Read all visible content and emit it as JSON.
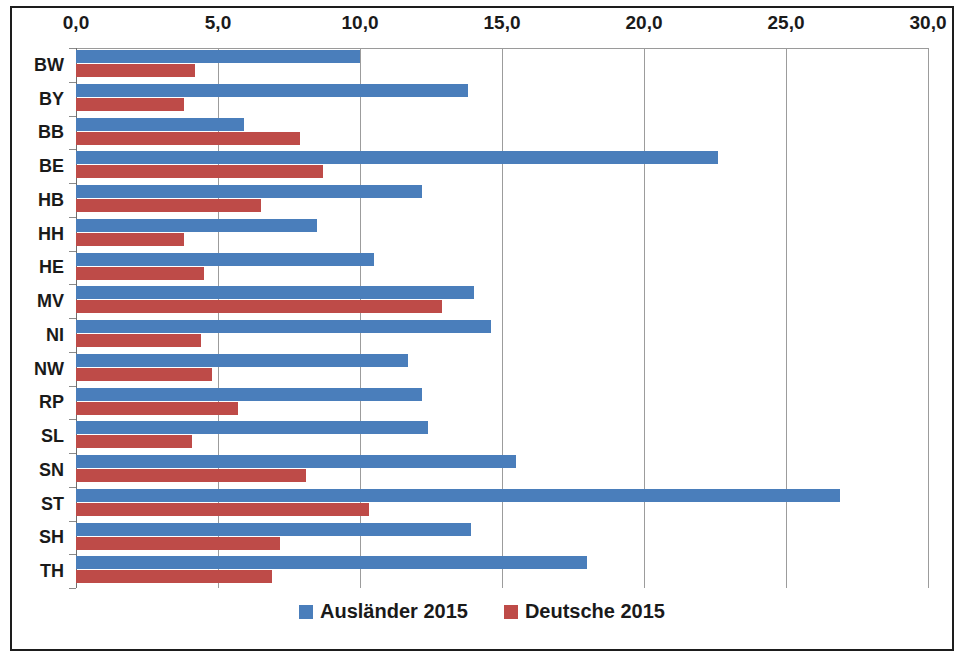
{
  "chart_data": {
    "type": "bar",
    "orientation": "horizontal",
    "title": "",
    "xlabel": "",
    "ylabel": "",
    "xlim": [
      0,
      30
    ],
    "xticks": [
      0,
      5,
      10,
      15,
      20,
      25,
      30
    ],
    "xtick_labels": [
      "0,0",
      "5,0",
      "10,0",
      "15,0",
      "20,0",
      "25,0",
      "30,0"
    ],
    "grid": true,
    "legend_position": "bottom",
    "categories": [
      "BW",
      "BY",
      "BB",
      "BE",
      "HB",
      "HH",
      "HE",
      "MV",
      "NI",
      "NW",
      "RP",
      "SL",
      "SN",
      "ST",
      "SH",
      "TH"
    ],
    "series": [
      {
        "name": "Ausländer 2015",
        "color": "#4A7EBB",
        "values": [
          10.0,
          13.8,
          5.9,
          22.6,
          12.2,
          8.5,
          10.5,
          14.0,
          14.6,
          11.7,
          12.2,
          12.4,
          15.5,
          26.9,
          13.9,
          18.0
        ]
      },
      {
        "name": "Deutsche 2015",
        "color": "#BE4B48",
        "values": [
          4.2,
          3.8,
          7.9,
          8.7,
          6.5,
          3.8,
          4.5,
          12.9,
          4.4,
          4.8,
          5.7,
          4.1,
          8.1,
          10.3,
          7.2,
          6.9
        ]
      }
    ]
  },
  "legend": {
    "items": [
      {
        "label": "Ausländer 2015",
        "color": "#4A7EBB",
        "swatch_name": "legend-swatch-auslaender"
      },
      {
        "label": "Deutsche 2015",
        "color": "#BE4B48",
        "swatch_name": "legend-swatch-deutsche"
      }
    ]
  }
}
